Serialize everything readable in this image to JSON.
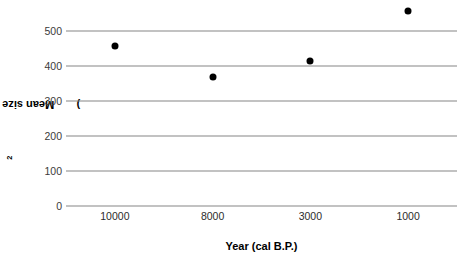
{
  "chart_data": {
    "type": "scatter",
    "title": "",
    "xlabel": "Year (cal B.P.)",
    "ylabel": "Mean size index (mm²)",
    "categories": [
      "10000",
      "8000",
      "3000",
      "1000"
    ],
    "x": [
      10000,
      8000,
      3000,
      1000
    ],
    "values": [
      457,
      369,
      414,
      557
    ],
    "series": [
      {
        "name": "Mean size index",
        "values": [
          457,
          369,
          414,
          557
        ],
        "marker": "filled-circle",
        "color": "#000000"
      }
    ],
    "ylim": [
      0,
      500
    ],
    "yticks": [
      0,
      100,
      200,
      300,
      400,
      500
    ],
    "ytick_labels": [
      "0",
      "100",
      "200",
      "300",
      "400",
      "500"
    ],
    "xtick_labels": [
      "10000",
      "8000",
      "3000",
      "1000"
    ],
    "grid": true,
    "grid_axis": "y",
    "grid_color": "#868686",
    "legend": false,
    "legend_position": "none",
    "background_color": "#ffffff",
    "note": "Data points extend above the top gridline (500); the 1000 cal B.P. point plots near 557."
  },
  "axes": {
    "y": {
      "title_main": "Mean size index (mm",
      "title_sup": "2",
      "title_close": ")",
      "ticks": [
        {
          "label": "500",
          "value": 500
        },
        {
          "label": "400",
          "value": 400
        },
        {
          "label": "300",
          "value": 300
        },
        {
          "label": "200",
          "value": 200
        },
        {
          "label": "100",
          "value": 100
        },
        {
          "label": "0",
          "value": 0
        }
      ]
    },
    "x": {
      "title": "Year (cal B.P.)",
      "ticks": [
        {
          "label": "10000",
          "value": 10000
        },
        {
          "label": "8000",
          "value": 8000
        },
        {
          "label": "3000",
          "value": 3000
        },
        {
          "label": "1000",
          "value": 1000
        }
      ]
    }
  },
  "points": [
    {
      "x_label": "10000",
      "y_value": 457
    },
    {
      "x_label": "8000",
      "y_value": 369
    },
    {
      "x_label": "3000",
      "y_value": 414
    },
    {
      "x_label": "1000",
      "y_value": 557
    }
  ]
}
